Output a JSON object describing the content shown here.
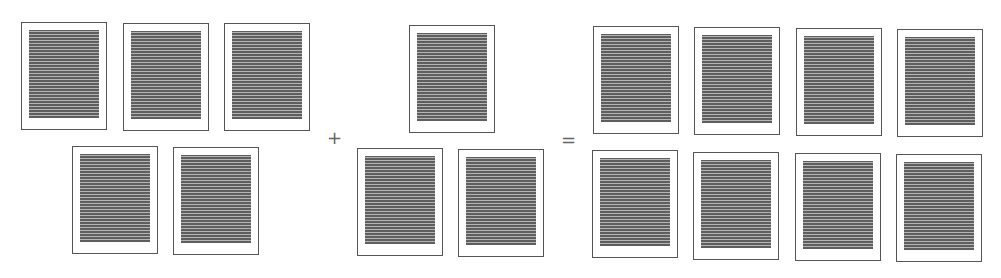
{
  "diagram": {
    "operators": {
      "plus": "+",
      "equals": "="
    },
    "groups": [
      {
        "name": "left-group",
        "count": 5,
        "pages": [
          {
            "x": 21,
            "y": 22
          },
          {
            "x": 123,
            "y": 23
          },
          {
            "x": 224,
            "y": 23
          },
          {
            "x": 72,
            "y": 146
          },
          {
            "x": 173,
            "y": 147
          }
        ]
      },
      {
        "name": "middle-group",
        "count": 3,
        "pages": [
          {
            "x": 409,
            "y": 25
          },
          {
            "x": 357,
            "y": 148
          },
          {
            "x": 458,
            "y": 149
          }
        ]
      },
      {
        "name": "result-group",
        "count": 8,
        "pages": [
          {
            "x": 593,
            "y": 26
          },
          {
            "x": 694,
            "y": 27
          },
          {
            "x": 796,
            "y": 28
          },
          {
            "x": 897,
            "y": 29
          },
          {
            "x": 592,
            "y": 150
          },
          {
            "x": 693,
            "y": 152
          },
          {
            "x": 795,
            "y": 153
          },
          {
            "x": 896,
            "y": 154
          }
        ]
      }
    ],
    "colors": {
      "page_border": "#555555",
      "text_dark": "#5e5e5e",
      "text_light": "#b4b4b4",
      "operator": "#666666"
    }
  }
}
